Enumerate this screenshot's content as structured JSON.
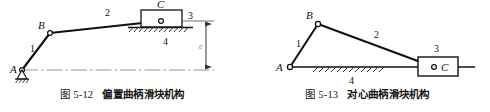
{
  "page": {
    "background": "#ffffff",
    "ink": "#111111",
    "thin_line": "#8a8a8a",
    "hatch_color": "#333333"
  },
  "figures": [
    {
      "id": "fig-5-12",
      "caption_number": "图 5-12",
      "caption_title": "偏置曲柄滑块机构",
      "joints": [
        {
          "name": "A",
          "label": "A",
          "type": "fixed-pivot",
          "x": 22,
          "y": 70
        },
        {
          "name": "B",
          "label": "B",
          "type": "pin-joint",
          "x": 50,
          "y": 33
        },
        {
          "name": "C",
          "label": "C",
          "type": "pin-joint",
          "x": 161,
          "y": 21
        }
      ],
      "links": [
        {
          "number": "1",
          "name": "crank",
          "label_x": 30,
          "label_y": 52
        },
        {
          "number": "2",
          "name": "coupler",
          "label_x": 105,
          "label_y": 16
        },
        {
          "number": "3",
          "name": "slider",
          "label_x": 188,
          "label_y": 19
        },
        {
          "number": "4",
          "name": "frame",
          "label_x": 163,
          "label_y": 45
        }
      ],
      "dimension": {
        "name": "offset",
        "label": "e",
        "label_x": 203,
        "label_y": 49
      }
    },
    {
      "id": "fig-5-13",
      "caption_number": "图 5-13",
      "caption_title": "对心曲柄滑块机构",
      "joints": [
        {
          "name": "A",
          "label": "A",
          "type": "pin-joint",
          "x": 45,
          "y": 67
        },
        {
          "name": "B",
          "label": "B",
          "type": "pin-joint",
          "x": 73,
          "y": 24
        },
        {
          "name": "C",
          "label": "C",
          "type": "pin-joint",
          "x": 189,
          "y": 67
        }
      ],
      "links": [
        {
          "number": "1",
          "name": "crank",
          "label_x": 51,
          "label_y": 47
        },
        {
          "number": "2",
          "name": "coupler",
          "label_x": 129,
          "label_y": 38
        },
        {
          "number": "3",
          "name": "slider",
          "label_x": 194,
          "label_y": 52
        },
        {
          "number": "4",
          "name": "frame",
          "label_x": 107,
          "label_y": 82
        }
      ]
    }
  ]
}
